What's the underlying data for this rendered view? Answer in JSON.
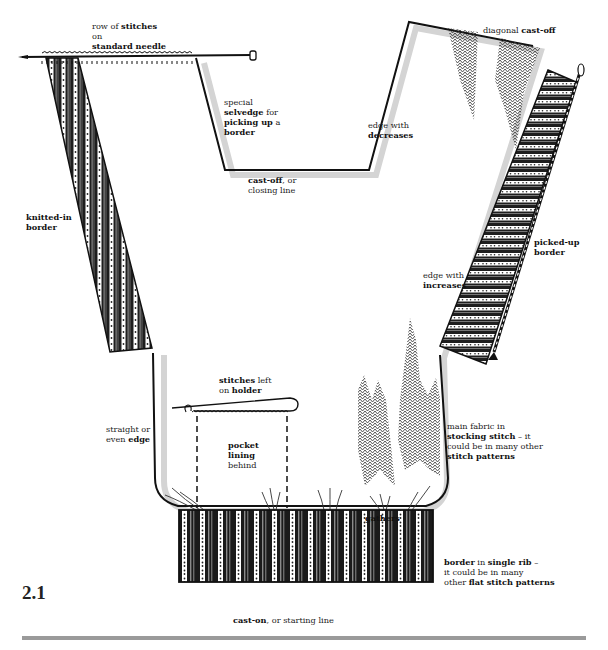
{
  "figure": {
    "number": "2.1"
  },
  "labels": {
    "row_of_stitches": [
      {
        "text": "row of ",
        "bold": false
      },
      {
        "text": "stitches",
        "bold": true
      },
      {
        "text": "on",
        "bold": false,
        "newline": true
      },
      {
        "text": "standard needle",
        "bold": true,
        "newline": true
      }
    ],
    "special_selvedge": [
      {
        "text": "special",
        "bold": false
      },
      {
        "text": "selvedge",
        "bold": true,
        "newline": true
      },
      {
        "text": " for",
        "bold": false
      },
      {
        "text": "picking up",
        "bold": true,
        "newline": true
      },
      {
        "text": " a",
        "bold": false
      },
      {
        "text": "border",
        "bold": true,
        "newline": true
      }
    ],
    "cast_off": [
      {
        "text": "cast-off",
        "bold": true
      },
      {
        "text": ", or",
        "bold": false
      },
      {
        "text": "closing line",
        "bold": false,
        "newline": true
      }
    ],
    "edge_decreases": [
      {
        "text": "edge with",
        "bold": false
      },
      {
        "text": "decreases",
        "bold": true,
        "newline": true
      }
    ],
    "diagonal_cast_off": [
      {
        "text": "diagonal ",
        "bold": false
      },
      {
        "text": "cast-off",
        "bold": true
      }
    ],
    "knitted_in_border": [
      {
        "text": "knitted-in",
        "bold": true
      },
      {
        "text": "border",
        "bold": true,
        "newline": true
      }
    ],
    "picked_up_border": [
      {
        "text": "picked-up",
        "bold": true
      },
      {
        "text": "border",
        "bold": true,
        "newline": true
      }
    ],
    "edge_increases": [
      {
        "text": "edge with",
        "bold": false
      },
      {
        "text": "increases",
        "bold": true,
        "newline": true
      }
    ],
    "stitches_holder": [
      {
        "text": "stitches",
        "bold": true
      },
      {
        "text": " left",
        "bold": false
      },
      {
        "text": "on ",
        "bold": false,
        "newline": true
      },
      {
        "text": "holder",
        "bold": true
      }
    ],
    "straight_edge": [
      {
        "text": "straight or",
        "bold": false
      },
      {
        "text": "even ",
        "bold": false,
        "newline": true
      },
      {
        "text": "edge",
        "bold": true
      }
    ],
    "pocket_lining": [
      {
        "text": "pocket",
        "bold": true
      },
      {
        "text": "lining",
        "bold": true,
        "newline": true
      },
      {
        "text": "behind",
        "bold": false,
        "newline": true
      }
    ],
    "main_fabric": [
      {
        "text": "main fabric in",
        "bold": false
      },
      {
        "text": "stocking stitch",
        "bold": true,
        "newline": true
      },
      {
        "text": " – it",
        "bold": false
      },
      {
        "text": "could be in many other",
        "bold": false,
        "newline": true
      },
      {
        "text": "stitch patterns",
        "bold": true,
        "newline": true
      }
    ],
    "gathers": [
      {
        "text": "gathers",
        "bold": true
      }
    ],
    "border_single_rib": [
      {
        "text": "border",
        "bold": true
      },
      {
        "text": " in ",
        "bold": false
      },
      {
        "text": "single rib",
        "bold": true
      },
      {
        "text": " –",
        "bold": false
      },
      {
        "text": "it could be in many",
        "bold": false,
        "newline": true
      },
      {
        "text": "other ",
        "bold": false,
        "newline": true
      },
      {
        "text": "flat stitch patterns",
        "bold": true
      }
    ],
    "cast_on": [
      {
        "text": "cast-on",
        "bold": true
      },
      {
        "text": ", or starting line",
        "bold": false
      }
    ]
  },
  "colors": {
    "ink": "#1a1a1a",
    "shadow": "#cfcfcf",
    "rule": "#9a9a9a",
    "background": "#ffffff"
  }
}
